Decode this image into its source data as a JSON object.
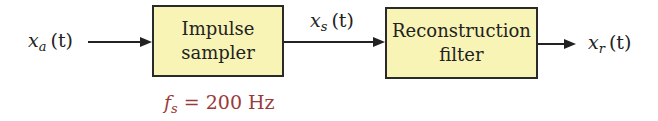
{
  "diagram": {
    "type": "block-diagram",
    "signals": {
      "input": {
        "symbol": "x",
        "subscript": "a",
        "arg": "(t)"
      },
      "sampled": {
        "symbol": "x",
        "subscript": "s",
        "arg": "(t)"
      },
      "output": {
        "symbol": "x",
        "subscript": "r",
        "arg": "(t)"
      }
    },
    "blocks": [
      {
        "line1": "Impulse",
        "line2": "sampler"
      },
      {
        "line1": "Reconstruction",
        "line2": "filter"
      }
    ],
    "parameter": {
      "symbol": "f",
      "subscript": "s",
      "rest": " = 200 Hz"
    },
    "colors": {
      "block_fill": "#f8f4b6",
      "parameter_text": "#9a3b3b"
    }
  }
}
